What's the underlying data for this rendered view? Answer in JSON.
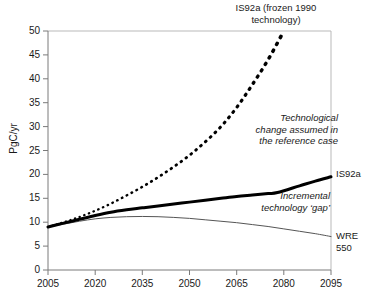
{
  "chart_data": {
    "type": "line",
    "title": "",
    "xlabel": "",
    "ylabel": "PgC/yr",
    "xlim": [
      2005,
      2095
    ],
    "ylim": [
      0,
      50
    ],
    "grid": false,
    "legend_position": "inline-annotations",
    "xticks": [
      "2005",
      "2020",
      "2035",
      "2050",
      "2065",
      "2080",
      "2095"
    ],
    "yticks": [
      "0",
      "5",
      "10",
      "15",
      "20",
      "25",
      "30",
      "35",
      "40",
      "45",
      "50"
    ],
    "series": [
      {
        "name": "IS92a (frozen 1990 technology)",
        "style": "dotted",
        "x": [
          2005,
          2010,
          2015,
          2020,
          2025,
          2030,
          2035,
          2040,
          2045,
          2050,
          2055,
          2060,
          2065,
          2070,
          2075,
          2080
        ],
        "values": [
          9.0,
          10.0,
          11.1,
          12.4,
          13.9,
          15.6,
          17.4,
          19.4,
          21.6,
          24.0,
          26.8,
          30.0,
          34.0,
          38.8,
          44.0,
          50.0
        ]
      },
      {
        "name": "IS92a",
        "style": "thick-solid",
        "x": [
          2005,
          2010,
          2015,
          2020,
          2025,
          2030,
          2035,
          2040,
          2045,
          2050,
          2055,
          2060,
          2065,
          2070,
          2075,
          2078,
          2085,
          2090,
          2095
        ],
        "values": [
          9.0,
          9.8,
          10.6,
          11.4,
          12.1,
          12.6,
          13.0,
          13.4,
          13.8,
          14.2,
          14.6,
          15.0,
          15.4,
          15.7,
          16.0,
          16.2,
          17.6,
          18.6,
          19.5
        ]
      },
      {
        "name": "WRE 550",
        "style": "thin-solid",
        "x": [
          2005,
          2010,
          2015,
          2020,
          2025,
          2030,
          2035,
          2040,
          2045,
          2050,
          2055,
          2060,
          2065,
          2070,
          2075,
          2080,
          2085,
          2090,
          2095
        ],
        "values": [
          9.0,
          9.6,
          10.2,
          10.7,
          11.0,
          11.15,
          11.2,
          11.15,
          11.0,
          10.8,
          10.5,
          10.2,
          9.9,
          9.5,
          9.1,
          8.6,
          8.1,
          7.6,
          7.0
        ]
      }
    ],
    "annotations": [
      {
        "name": "series-top-label",
        "text": "IS92a (frozen 1990\ntechnology)",
        "style": "regular"
      },
      {
        "name": "reference-case",
        "text": "Technological\nchange assumed in\nthe reference case",
        "style": "italic"
      },
      {
        "name": "technology-gap",
        "text": "Incremental\ntechnology ‘gap’",
        "style": "italic"
      },
      {
        "name": "is92a-end-label",
        "text": "IS92a",
        "style": "regular"
      },
      {
        "name": "wre550-end-label",
        "text": "WRE\n550",
        "style": "regular"
      }
    ],
    "colors": {
      "line": "#000000",
      "thin_line": "#555555",
      "frame": "#b9b9b9",
      "axis": "#6e6e6e",
      "text": "#1a1a1a",
      "background": "#ffffff"
    }
  }
}
